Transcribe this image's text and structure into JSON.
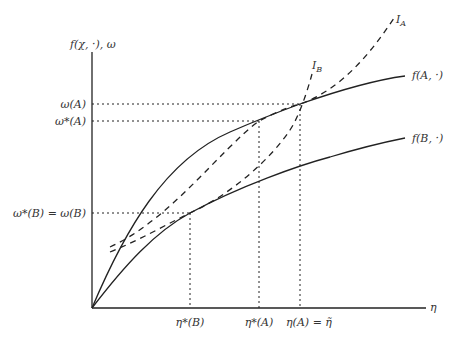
{
  "diagram": {
    "y_axis_label": "f(χ, ·),  ω",
    "x_axis_label": "η",
    "curves": [
      {
        "id": "fA",
        "label": "f(A, ·)",
        "style": "solid"
      },
      {
        "id": "fB",
        "label": "f(B, ·)",
        "style": "solid"
      },
      {
        "id": "IA",
        "label": "I",
        "subscript": "A",
        "style": "dashed"
      },
      {
        "id": "IB",
        "label": "I",
        "subscript": "B",
        "style": "dashed"
      }
    ],
    "y_ticks": [
      {
        "label": "ω(A)"
      },
      {
        "label": "ω*(A)"
      },
      {
        "label": "ω*(B) = ω(B)"
      }
    ],
    "x_ticks": [
      {
        "label": "η*(B)"
      },
      {
        "label": "η*(A)"
      },
      {
        "label": "η(A) = η̃"
      }
    ]
  }
}
